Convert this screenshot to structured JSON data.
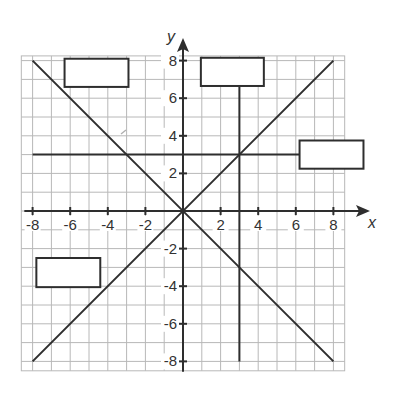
{
  "diagram": {
    "type": "coordinate-plane",
    "axes": {
      "x_label": "x",
      "y_label": "y",
      "x_ticks": [
        {
          "value": -8,
          "label": "-8"
        },
        {
          "value": -6,
          "label": "-6"
        },
        {
          "value": -4,
          "label": "-4"
        },
        {
          "value": -2,
          "label": "-2"
        },
        {
          "value": 2,
          "label": "2"
        },
        {
          "value": 4,
          "label": "4"
        },
        {
          "value": 6,
          "label": "6"
        },
        {
          "value": 8,
          "label": "8"
        }
      ],
      "y_ticks": [
        {
          "value": 8,
          "label": "8"
        },
        {
          "value": 6,
          "label": "6"
        },
        {
          "value": 4,
          "label": "4"
        },
        {
          "value": 2,
          "label": "2"
        },
        {
          "value": -2,
          "label": "-2"
        },
        {
          "value": -4,
          "label": "-4"
        },
        {
          "value": -6,
          "label": "-6"
        },
        {
          "value": -8,
          "label": "-8"
        }
      ],
      "xlim": [
        -8.6,
        8.6
      ],
      "ylim": [
        -8.5,
        8.25
      ],
      "grid_step": 1
    },
    "lines": [
      {
        "name": "y-equals-x",
        "from": [
          -8,
          -8
        ],
        "to": [
          8,
          8
        ]
      },
      {
        "name": "y-equals-negative-x",
        "from": [
          -8,
          8
        ],
        "to": [
          8,
          -8
        ]
      },
      {
        "name": "y-equals-3",
        "from": [
          -8,
          3
        ],
        "to": [
          6.2,
          3
        ]
      },
      {
        "name": "x-equals-3",
        "from": [
          3,
          6.6
        ],
        "to": [
          3,
          -8
        ]
      }
    ],
    "label_boxes": [
      {
        "name": "answer-box-top-left",
        "text": "",
        "x": [
          -6.3,
          -2.9
        ],
        "y": [
          8.1,
          6.6
        ]
      },
      {
        "name": "answer-box-top-middle",
        "text": "",
        "x": [
          0.95,
          4.3
        ],
        "y": [
          8.15,
          6.65
        ]
      },
      {
        "name": "answer-box-right",
        "text": "",
        "x": [
          6.2,
          9.6
        ],
        "y": [
          3.75,
          2.25
        ]
      },
      {
        "name": "answer-box-bottom-left",
        "text": "",
        "x": [
          -7.8,
          -4.4
        ],
        "y": [
          -2.5,
          -4.05
        ]
      }
    ],
    "colors": {
      "grid": "#b8b8b8",
      "line": "#2e2e2e",
      "text": "#333333",
      "background": "#ffffff"
    }
  }
}
